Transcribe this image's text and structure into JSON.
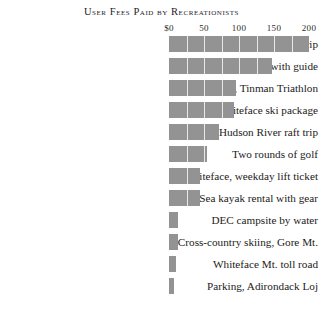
{
  "chart_data": {
    "type": "bar",
    "title": "User Fees Paid by Recreationists",
    "orientation": "horizontal",
    "xlabel": "",
    "ylabel": "",
    "xlim": [
      0,
      210
    ],
    "grid": true,
    "grid_axis": "x",
    "legend": "none",
    "bar_color": "#939393",
    "gridline_color": "#e8e8e8",
    "tick_labels": [
      "$0",
      "50",
      "100",
      "150",
      "200"
    ],
    "tick_values": [
      0,
      50,
      100,
      150,
      200
    ],
    "categories": [
      "Fly-in fishing trip",
      "Rock climbing with guide",
      "Entry fee, Tinman Triathlon",
      "Whiteface ski package",
      "Hudson River raft trip",
      "Two rounds of golf",
      "Whiteface, weekday lift ticket",
      "Sea kayak rental with gear",
      "DEC campsite by water",
      "Cross-country skiing, Gore Mt.",
      "Whiteface Mt. toll road",
      "Parking, Adirondack Loj"
    ],
    "values": [
      200,
      147,
      96,
      93,
      71,
      54,
      44,
      44,
      13,
      13,
      10,
      7
    ]
  }
}
